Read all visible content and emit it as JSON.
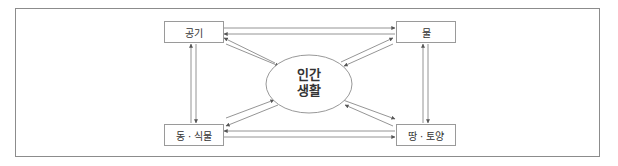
{
  "diagram": {
    "center": {
      "line1": "인간",
      "line2": "생활"
    },
    "nodes": {
      "air": "공기",
      "water": "물",
      "flora_fauna": "동 · 식물",
      "soil": "땅 · 토양"
    },
    "edges": [
      {
        "from": "공기",
        "to": "물",
        "bidirectional": true
      },
      {
        "from": "동 · 식물",
        "to": "땅 · 토양",
        "bidirectional": true
      },
      {
        "from": "공기",
        "to": "동 · 식물",
        "bidirectional": true
      },
      {
        "from": "물",
        "to": "땅 · 토양",
        "bidirectional": true
      },
      {
        "from": "인간 생활",
        "to": "공기",
        "bidirectional": true
      },
      {
        "from": "인간 생활",
        "to": "물",
        "bidirectional": true
      },
      {
        "from": "인간 생활",
        "to": "동 · 식물",
        "bidirectional": true
      },
      {
        "from": "인간 생활",
        "to": "땅 · 토양",
        "bidirectional": true
      }
    ],
    "colors": {
      "line": "#7a7a7a",
      "border": "#8c8c8c",
      "text": "#333333"
    }
  }
}
